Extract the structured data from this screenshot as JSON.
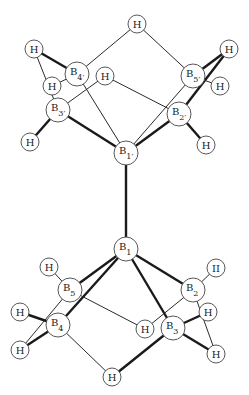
{
  "diagram": {
    "upper_unit": {
      "atoms": [
        {
          "id": "B1p",
          "el": "B",
          "sub": "1′",
          "x": 126,
          "y": 153,
          "r": 12
        },
        {
          "id": "B2p",
          "el": "B",
          "sub": "2′",
          "x": 179,
          "y": 114,
          "r": 12
        },
        {
          "id": "B3p",
          "el": "B",
          "sub": "3′",
          "x": 58,
          "y": 110,
          "r": 12
        },
        {
          "id": "B4p",
          "el": "B",
          "sub": "4′",
          "x": 77,
          "y": 74,
          "r": 12
        },
        {
          "id": "B5p",
          "el": "B",
          "sub": "5′",
          "x": 193,
          "y": 76,
          "r": 12
        },
        {
          "id": "Ht",
          "el": "H",
          "sub": "",
          "x": 137,
          "y": 24,
          "r": 9
        },
        {
          "id": "Hlt",
          "el": "H",
          "sub": "",
          "x": 34,
          "y": 49,
          "r": 9
        },
        {
          "id": "Hb4",
          "el": "H",
          "sub": "",
          "x": 52,
          "y": 86,
          "r": 9
        },
        {
          "id": "Hc",
          "el": "H",
          "sub": "",
          "x": 105,
          "y": 76,
          "r": 9
        },
        {
          "id": "Hrt",
          "el": "H",
          "sub": "",
          "x": 229,
          "y": 49,
          "r": 9
        },
        {
          "id": "Hb5",
          "el": "H",
          "sub": "",
          "x": 220,
          "y": 86,
          "r": 9
        },
        {
          "id": "Hlb",
          "el": "H",
          "sub": "",
          "x": 30,
          "y": 142,
          "r": 9
        },
        {
          "id": "Hrb",
          "el": "H",
          "sub": "",
          "x": 206,
          "y": 145,
          "r": 9
        }
      ]
    },
    "lower_unit": {
      "atoms": [
        {
          "id": "B1",
          "el": "B",
          "sub": "1",
          "x": 126,
          "y": 249,
          "r": 12
        },
        {
          "id": "B2",
          "el": "B",
          "sub": "2",
          "x": 193,
          "y": 290,
          "r": 12
        },
        {
          "id": "B3",
          "el": "B",
          "sub": "3",
          "x": 173,
          "y": 328,
          "r": 12
        },
        {
          "id": "B4",
          "el": "B",
          "sub": "4",
          "x": 58,
          "y": 325,
          "r": 12
        },
        {
          "id": "B5",
          "el": "B",
          "sub": "5",
          "x": 70,
          "y": 290,
          "r": 12
        },
        {
          "id": "Hul",
          "el": "H",
          "sub": "",
          "x": 49,
          "y": 267,
          "r": 9
        },
        {
          "id": "Hur",
          "el": "H",
          "sub": "",
          "x": 216,
          "y": 268,
          "r": 9,
          "label_override": "II"
        },
        {
          "id": "Hl",
          "el": "H",
          "sub": "",
          "x": 20,
          "y": 312,
          "r": 9
        },
        {
          "id": "Hc2",
          "el": "H",
          "sub": "",
          "x": 145,
          "y": 329,
          "r": 9
        },
        {
          "id": "Hr",
          "el": "H",
          "sub": "",
          "x": 208,
          "y": 312,
          "r": 9
        },
        {
          "id": "Hll",
          "el": "H",
          "sub": "",
          "x": 20,
          "y": 350,
          "r": 9
        },
        {
          "id": "Hlr",
          "el": "H",
          "sub": "",
          "x": 216,
          "y": 354,
          "r": 9
        },
        {
          "id": "Hbot",
          "el": "H",
          "sub": "",
          "x": 112,
          "y": 377,
          "r": 9
        }
      ]
    },
    "bonds": [
      {
        "a": "B1p",
        "b": "B1",
        "w": "thick"
      },
      {
        "a": "Ht",
        "b": "B4p",
        "w": "thin"
      },
      {
        "a": "Ht",
        "b": "B5p",
        "w": "thin"
      },
      {
        "a": "Hlt",
        "b": "B4p",
        "w": "thick"
      },
      {
        "a": "Hlt",
        "b": "B3p",
        "w": "thin"
      },
      {
        "a": "Hb4",
        "b": "B4p",
        "w": "thin"
      },
      {
        "a": "Hc",
        "b": "B3p",
        "w": "thin"
      },
      {
        "a": "Hc",
        "b": "B2p",
        "w": "thin"
      },
      {
        "a": "Hrt",
        "b": "B5p",
        "w": "thick"
      },
      {
        "a": "Hrt",
        "b": "B2p",
        "w": "thick"
      },
      {
        "a": "Hb5",
        "b": "B5p",
        "w": "thin"
      },
      {
        "a": "B4p",
        "b": "B1p",
        "w": "thin"
      },
      {
        "a": "B5p",
        "b": "B1p",
        "w": "thin"
      },
      {
        "a": "B3p",
        "b": "B1p",
        "w": "thick"
      },
      {
        "a": "B2p",
        "b": "B1p",
        "w": "thick"
      },
      {
        "a": "Hlb",
        "b": "B3p",
        "w": "thick"
      },
      {
        "a": "Hrb",
        "b": "B2p",
        "w": "thick"
      },
      {
        "a": "B1",
        "b": "B5",
        "w": "thick"
      },
      {
        "a": "B1",
        "b": "B4",
        "w": "thick"
      },
      {
        "a": "B1",
        "b": "B2",
        "w": "thick"
      },
      {
        "a": "B1",
        "b": "B3",
        "w": "thick"
      },
      {
        "a": "Hul",
        "b": "B5",
        "w": "thin"
      },
      {
        "a": "Hur",
        "b": "B2",
        "w": "thin"
      },
      {
        "a": "B5",
        "b": "Hc2",
        "w": "thin"
      },
      {
        "a": "B2",
        "b": "Hc2",
        "w": "thin"
      },
      {
        "a": "B5",
        "b": "Hll",
        "w": "thin"
      },
      {
        "a": "Hl",
        "b": "B4",
        "w": "thick"
      },
      {
        "a": "Hll",
        "b": "B4",
        "w": "thick"
      },
      {
        "a": "B2",
        "b": "Hlr",
        "w": "thin"
      },
      {
        "a": "Hr",
        "b": "B3",
        "w": "thick"
      },
      {
        "a": "Hlr",
        "b": "B3",
        "w": "thick"
      },
      {
        "a": "B4",
        "b": "Hbot",
        "w": "thin"
      },
      {
        "a": "B3",
        "b": "Hbot",
        "w": "thick"
      }
    ]
  }
}
